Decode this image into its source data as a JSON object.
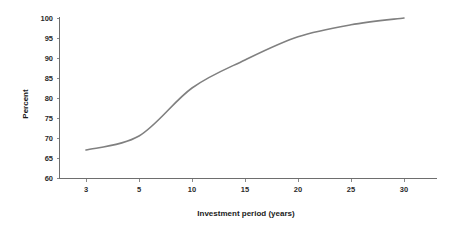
{
  "chart_data": {
    "type": "line",
    "title": "",
    "xlabel": "Investment period (years)",
    "ylabel": "Percent",
    "x": [
      3,
      5,
      10,
      15,
      20,
      25,
      30
    ],
    "categories": [
      "3",
      "5",
      "10",
      "15",
      "20",
      "25",
      "30"
    ],
    "values": [
      67,
      70.5,
      82.5,
      89.5,
      95.3,
      98.3,
      100
    ],
    "series": [
      {
        "name": "Percent",
        "values": [
          67,
          70.5,
          82.5,
          89.5,
          95.3,
          98.3,
          100
        ]
      }
    ],
    "ylim": [
      60,
      100
    ],
    "ytick_step": 5,
    "yticks": [
      60,
      65,
      70,
      75,
      80,
      85,
      90,
      95,
      100
    ],
    "ytick_labels": [
      "60",
      "65",
      "70",
      "75",
      "80",
      "85",
      "90",
      "95",
      "100"
    ],
    "xticks": [
      3,
      5,
      10,
      15,
      20,
      25,
      30
    ],
    "xtick_labels": [
      "3",
      "5",
      "10",
      "15",
      "20",
      "25",
      "30"
    ],
    "grid": false,
    "legend": "none",
    "line_color": "#808080",
    "axis_color": "#6e6e6e",
    "text_color": "#1a1a1a",
    "background_color": "#ffffff",
    "annotations": []
  },
  "axis_titles": {
    "x": "Investment period (years)",
    "y": "Percent"
  }
}
